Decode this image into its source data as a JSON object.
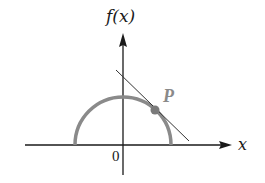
{
  "diagram": {
    "type": "function-graph",
    "labels": {
      "y_axis": "f(x)",
      "x_axis": "x",
      "origin": "0",
      "point": "P"
    },
    "elements": {
      "curve": "upper semicircle centered at origin",
      "tangent_line": "line tangent to semicircle at P, negative slope",
      "point_P": "point on semicircle in first quadrant"
    },
    "colors": {
      "axes": "#1a1a1a",
      "curve": "#8a8a8a",
      "tangent": "#333333",
      "point": "#7a7a7a",
      "point_label": "#8a8a8a"
    }
  }
}
